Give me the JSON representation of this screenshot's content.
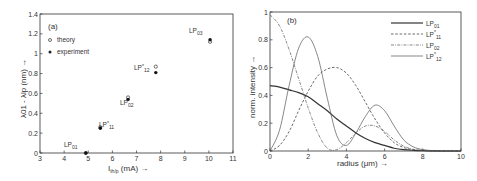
{
  "chart_data": [
    {
      "type": "scatter",
      "panel_label": "(a)",
      "xlabel": "I_th/p (mA) →",
      "xlabel_main": "I",
      "xlabel_sub": "th/p",
      "xlabel_unit": " (mA) →",
      "ylabel": "λ01 - λlp (nm) →",
      "xlim": [
        3,
        11
      ],
      "ylim": [
        0,
        1.4
      ],
      "xticks": [
        "3",
        "4",
        "5",
        "6",
        "7",
        "8",
        "9",
        "10",
        "11"
      ],
      "yticks": [
        "0",
        "0.2",
        "0.4",
        "0.6",
        "0.8",
        "1",
        "1.2",
        "1.4"
      ],
      "grid": false,
      "legend": [
        {
          "marker": "open-circle",
          "label": "theory"
        },
        {
          "marker": "filled-circle",
          "label": "experiment"
        }
      ],
      "series": [
        {
          "name": "theory",
          "points": [
            {
              "mode": "LP01",
              "x": 4.9,
              "y": 0.0
            },
            {
              "mode": "LP*11",
              "x": 5.5,
              "y": 0.26
            },
            {
              "mode": "LP02",
              "x": 6.65,
              "y": 0.56
            },
            {
              "mode": "LP*12",
              "x": 7.8,
              "y": 0.87
            },
            {
              "mode": "LP03",
              "x": 10.05,
              "y": 1.12
            }
          ]
        },
        {
          "name": "experiment",
          "points": [
            {
              "mode": "LP01",
              "x": 4.9,
              "y": 0.0
            },
            {
              "mode": "LP*11",
              "x": 5.5,
              "y": 0.25
            },
            {
              "mode": "LP02",
              "x": 6.65,
              "y": 0.54
            },
            {
              "mode": "LP*12",
              "x": 7.8,
              "y": 0.81
            },
            {
              "mode": "LP03",
              "x": 10.05,
              "y": 1.14
            }
          ]
        }
      ],
      "annotations": [
        {
          "text": "LP",
          "sub": "01",
          "sup": ""
        },
        {
          "text": "LP",
          "sub": "11",
          "sup": "*"
        },
        {
          "text": "LP",
          "sub": "02",
          "sup": ""
        },
        {
          "text": "LP",
          "sub": "12",
          "sup": "*"
        },
        {
          "text": "LP",
          "sub": "03",
          "sup": ""
        }
      ]
    },
    {
      "type": "line",
      "panel_label": "(b)",
      "xlabel": "radius (μm) →",
      "ylabel": "norm. intensity →",
      "xlim": [
        0,
        10
      ],
      "ylim": [
        0,
        1
      ],
      "xticks": [
        "0",
        "2",
        "4",
        "6",
        "8",
        "10"
      ],
      "yticks": [
        "0",
        "0.2",
        "0.4",
        "0.6",
        "0.8",
        "1"
      ],
      "grid": false,
      "legend_position": "upper right",
      "x": [
        0,
        0.5,
        1,
        1.5,
        2,
        2.5,
        3,
        3.5,
        4,
        4.5,
        5,
        5.5,
        6,
        6.5,
        7,
        7.5,
        8,
        8.5,
        9,
        9.5,
        10
      ],
      "series": [
        {
          "name": "LP01",
          "style": "solid-thick",
          "values": [
            0.47,
            0.46,
            0.44,
            0.42,
            0.39,
            0.34,
            0.29,
            0.23,
            0.18,
            0.13,
            0.09,
            0.06,
            0.04,
            0.02,
            0.01,
            0.005,
            0.002,
            0.001,
            0,
            0,
            0
          ]
        },
        {
          "name": "LP*11",
          "style": "dashed",
          "values": [
            0,
            0.04,
            0.14,
            0.29,
            0.43,
            0.54,
            0.59,
            0.6,
            0.56,
            0.47,
            0.35,
            0.23,
            0.13,
            0.06,
            0.025,
            0.01,
            0.004,
            0.001,
            0,
            0,
            0
          ]
        },
        {
          "name": "LP02",
          "style": "dash-dot",
          "values": [
            0.98,
            0.9,
            0.73,
            0.52,
            0.31,
            0.13,
            0.02,
            0.01,
            0.06,
            0.13,
            0.18,
            0.18,
            0.14,
            0.08,
            0.035,
            0.012,
            0.004,
            0.001,
            0,
            0,
            0
          ]
        },
        {
          "name": "LP*12",
          "style": "solid-thin",
          "values": [
            0,
            0.15,
            0.47,
            0.74,
            0.82,
            0.68,
            0.38,
            0.11,
            0.04,
            0.13,
            0.25,
            0.33,
            0.29,
            0.18,
            0.08,
            0.03,
            0.01,
            0.003,
            0,
            0,
            0
          ]
        }
      ],
      "legend": [
        {
          "label": "LP",
          "sub": "01",
          "sup": ""
        },
        {
          "label": "LP",
          "sub": "11",
          "sup": "*"
        },
        {
          "label": "LP",
          "sub": "02",
          "sup": ""
        },
        {
          "label": "LP",
          "sub": "12",
          "sup": "*"
        }
      ]
    }
  ]
}
